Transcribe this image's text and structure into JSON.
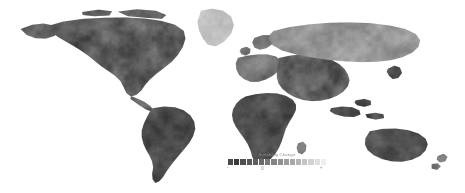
{
  "figure": {
    "kind": "world-map",
    "background_color": "#ffffff",
    "ocean_color": "#ffffff",
    "width": 465,
    "height": 193
  },
  "legend": {
    "title": "Suitability Change",
    "title_color": "#8a8a8a",
    "orientation": "horizontal",
    "ticks": [
      {
        "label": "−",
        "position_pct": 0
      },
      {
        "label": "0",
        "position_pct": 35
      },
      {
        "label": "+",
        "position_pct": 95
      }
    ],
    "swatches": [
      "#4a4a4a",
      "#3a3a3a",
      "#4f4f4f",
      "#585858",
      "#5e5e5e",
      "#6a6a6a",
      "#767676",
      "#838383",
      "#8f8f8f",
      "#9c9c9c",
      "#a8a8a8",
      "#b6b6b6",
      "#c4c4c4",
      "#d2d2d2",
      "#e0e0e0",
      "#eeeeee"
    ]
  },
  "map_data": {
    "type": "choropleth-raster",
    "variable": "Suitability Change",
    "colormap": "grayscale-diverging",
    "projection": "equirectangular",
    "landmasses": [
      {
        "name": "North America",
        "tone": "dark-to-mid"
      },
      {
        "name": "Greenland",
        "tone": "light"
      },
      {
        "name": "South America",
        "tone": "dark"
      },
      {
        "name": "Africa",
        "tone": "dark"
      },
      {
        "name": "Europe",
        "tone": "mid"
      },
      {
        "name": "Asia",
        "tone": "dark-to-mid"
      },
      {
        "name": "Siberia",
        "tone": "mid-light"
      },
      {
        "name": "Australia",
        "tone": "dark"
      },
      {
        "name": "New Zealand",
        "tone": "mid"
      },
      {
        "name": "Southeast Asia Islands",
        "tone": "dark"
      },
      {
        "name": "Madagascar",
        "tone": "mid"
      },
      {
        "name": "Japan",
        "tone": "dark"
      },
      {
        "name": "British Isles",
        "tone": "mid"
      }
    ]
  }
}
